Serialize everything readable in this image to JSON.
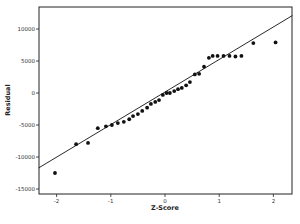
{
  "chart_data": {
    "type": "scatter",
    "title": "",
    "xlabel": "Z-Score",
    "ylabel": "Residual",
    "xlim": [
      -2.35,
      2.35
    ],
    "ylim": [
      -15500,
      13500
    ],
    "x_ticks": [
      -2,
      -1,
      0,
      1,
      2
    ],
    "y_ticks": [
      10000,
      5000,
      0,
      -5000,
      -10000,
      -15000
    ],
    "grid": false,
    "legend": null,
    "fit_line": {
      "x": [
        -2.33,
        2.35
      ],
      "y": [
        -11700,
        12100
      ]
    },
    "points": [
      {
        "x": -2.03,
        "y": -12500
      },
      {
        "x": -1.64,
        "y": -8000
      },
      {
        "x": -1.42,
        "y": -7800
      },
      {
        "x": -1.24,
        "y": -5500
      },
      {
        "x": -1.09,
        "y": -5200
      },
      {
        "x": -0.98,
        "y": -5000
      },
      {
        "x": -0.87,
        "y": -4700
      },
      {
        "x": -0.76,
        "y": -4500
      },
      {
        "x": -0.66,
        "y": -4100
      },
      {
        "x": -0.59,
        "y": -3600
      },
      {
        "x": -0.5,
        "y": -3300
      },
      {
        "x": -0.42,
        "y": -2800
      },
      {
        "x": -0.33,
        "y": -2300
      },
      {
        "x": -0.26,
        "y": -1700
      },
      {
        "x": -0.18,
        "y": -1400
      },
      {
        "x": -0.11,
        "y": -1100
      },
      {
        "x": -0.04,
        "y": -300
      },
      {
        "x": 0.03,
        "y": 0
      },
      {
        "x": 0.09,
        "y": 0
      },
      {
        "x": 0.17,
        "y": 300
      },
      {
        "x": 0.24,
        "y": 600
      },
      {
        "x": 0.31,
        "y": 800
      },
      {
        "x": 0.39,
        "y": 1200
      },
      {
        "x": 0.46,
        "y": 1700
      },
      {
        "x": 0.55,
        "y": 2900
      },
      {
        "x": 0.63,
        "y": 3000
      },
      {
        "x": 0.72,
        "y": 4100
      },
      {
        "x": 0.81,
        "y": 5500
      },
      {
        "x": 0.88,
        "y": 5800
      },
      {
        "x": 0.97,
        "y": 5800
      },
      {
        "x": 1.08,
        "y": 5800
      },
      {
        "x": 1.19,
        "y": 5800
      },
      {
        "x": 1.3,
        "y": 5700
      },
      {
        "x": 1.41,
        "y": 5800
      },
      {
        "x": 1.63,
        "y": 7800
      },
      {
        "x": 2.04,
        "y": 7900
      }
    ]
  },
  "labels": {
    "xlabel": "Z-Score",
    "ylabel": "Residual",
    "x_ticks": [
      "-2",
      "-1",
      "0",
      "1",
      "2"
    ],
    "y_ticks": [
      "10000",
      "5000",
      "0",
      "-5000",
      "-10000",
      "-15000"
    ]
  }
}
